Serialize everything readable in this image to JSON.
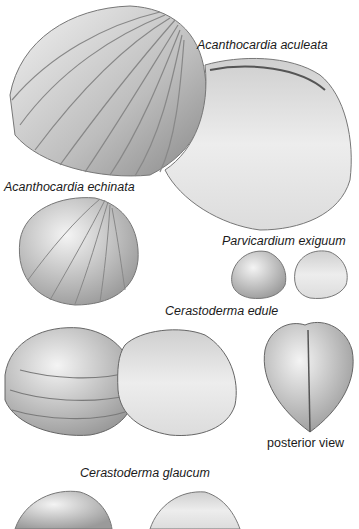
{
  "labels": {
    "aculeata": "Acanthocardia aculeata",
    "echinata": "Acanthocardia echinata",
    "exiguum": "Parvicardium exiguum",
    "edule": "Cerastoderma edule",
    "posterior": "posterior view",
    "glaucum": "Cerastoderma glaucum"
  },
  "colors": {
    "background": "#ffffff",
    "shell_light": "#e6e6e6",
    "shell_mid": "#a8a8a8",
    "shell_dark": "#555555",
    "text": "#1a1a1a"
  }
}
